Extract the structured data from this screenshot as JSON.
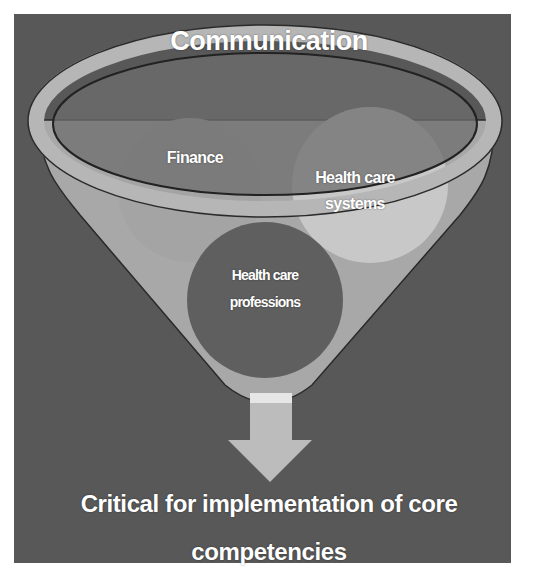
{
  "diagram": {
    "type": "funnel",
    "title": "Communication",
    "circles": [
      {
        "label_lines": [
          "Finance"
        ],
        "shade": "#9c9c9c"
      },
      {
        "label_lines": [
          "Health care",
          "systems"
        ],
        "shade": "#c6c6c6"
      },
      {
        "label_lines": [
          "Health care",
          "professions"
        ],
        "shade": "#5f5f5f"
      }
    ],
    "arrow": {
      "direction": "down",
      "color": "#bdbdbd"
    },
    "output_lines": [
      "Critical for implementation of core",
      "competencies"
    ]
  },
  "colors": {
    "background": "#585858",
    "funnel_body": "#a8a8a8",
    "funnel_rim": "#b4b4b4",
    "funnel_mouth": "#747474",
    "text": "#ffffff"
  }
}
